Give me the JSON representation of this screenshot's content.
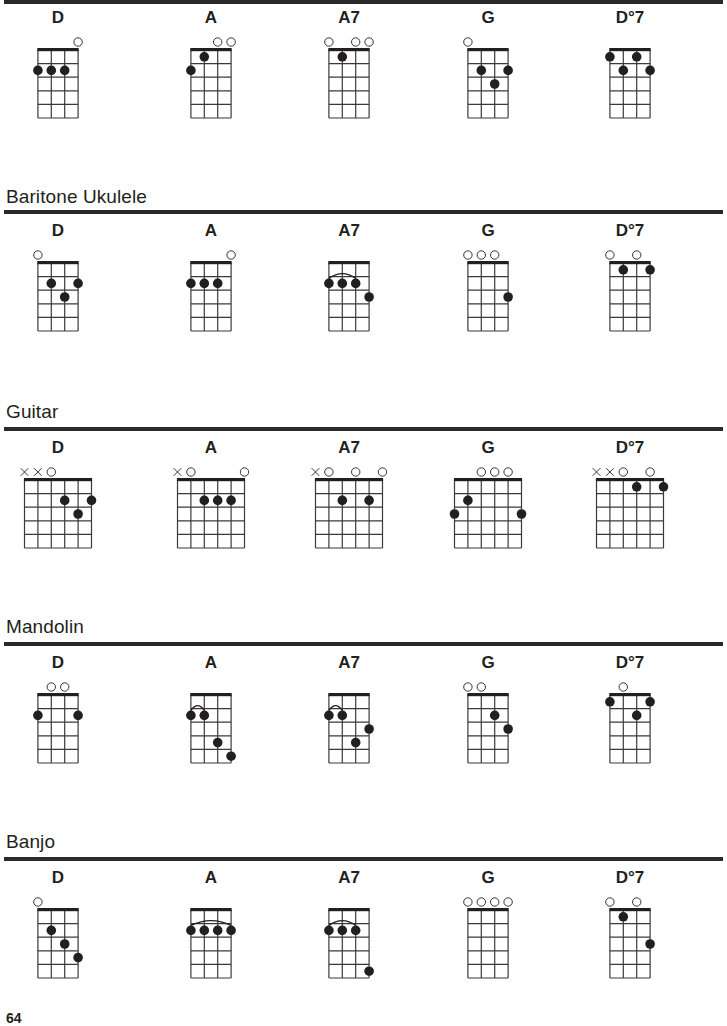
{
  "page": {
    "page_number": "64",
    "chord_names": [
      "D",
      "A",
      "A7",
      "G",
      "D°7"
    ]
  },
  "sections": [
    {
      "id": "ukulele",
      "title": "",
      "strings": 4,
      "frets": 5,
      "chords": [
        {
          "name": "D",
          "open": [
            4
          ],
          "muted": [],
          "dots": [
            [
              1,
              2
            ],
            [
              2,
              2
            ],
            [
              3,
              2
            ]
          ],
          "barre": null
        },
        {
          "name": "A",
          "open": [
            3,
            4
          ],
          "muted": [],
          "dots": [
            [
              1,
              2
            ],
            [
              2,
              1
            ]
          ],
          "barre": null
        },
        {
          "name": "A7",
          "open": [
            1,
            3,
            4
          ],
          "muted": [],
          "dots": [
            [
              2,
              1
            ]
          ],
          "barre": null
        },
        {
          "name": "G",
          "open": [
            1
          ],
          "muted": [],
          "dots": [
            [
              2,
              2
            ],
            [
              3,
              3
            ],
            [
              4,
              2
            ]
          ],
          "barre": null
        },
        {
          "name": "D°7",
          "open": [],
          "muted": [],
          "dots": [
            [
              1,
              1
            ],
            [
              2,
              2
            ],
            [
              3,
              1
            ],
            [
              4,
              2
            ]
          ],
          "barre": null
        }
      ]
    },
    {
      "id": "baritone-ukulele",
      "title": "Baritone Ukulele",
      "strings": 4,
      "frets": 5,
      "chords": [
        {
          "name": "D",
          "open": [
            1
          ],
          "muted": [],
          "dots": [
            [
              2,
              2
            ],
            [
              3,
              3
            ],
            [
              4,
              2
            ]
          ],
          "barre": null
        },
        {
          "name": "A",
          "open": [
            4
          ],
          "muted": [],
          "dots": [
            [
              1,
              2
            ],
            [
              2,
              2
            ],
            [
              3,
              2
            ]
          ],
          "barre": null
        },
        {
          "name": "A7",
          "open": [],
          "muted": [],
          "dots": [
            [
              1,
              2
            ],
            [
              2,
              2
            ],
            [
              3,
              2
            ],
            [
              4,
              3
            ]
          ],
          "barre": [
            1,
            3,
            2
          ]
        },
        {
          "name": "G",
          "open": [
            1,
            2,
            3
          ],
          "muted": [],
          "dots": [
            [
              4,
              3
            ]
          ],
          "barre": null
        },
        {
          "name": "D°7",
          "open": [
            1,
            3
          ],
          "muted": [],
          "dots": [
            [
              2,
              1
            ],
            [
              4,
              1
            ]
          ],
          "barre": null
        }
      ]
    },
    {
      "id": "guitar",
      "title": "Guitar",
      "strings": 6,
      "frets": 5,
      "chords": [
        {
          "name": "D",
          "open": [
            3
          ],
          "muted": [
            1,
            2
          ],
          "dots": [
            [
              4,
              2
            ],
            [
              5,
              3
            ],
            [
              6,
              2
            ]
          ],
          "barre": null
        },
        {
          "name": "A",
          "open": [
            2,
            6
          ],
          "muted": [
            1
          ],
          "dots": [
            [
              3,
              2
            ],
            [
              4,
              2
            ],
            [
              5,
              2
            ]
          ],
          "barre": null
        },
        {
          "name": "A7",
          "open": [
            2,
            4,
            6
          ],
          "muted": [
            1
          ],
          "dots": [
            [
              3,
              2
            ],
            [
              5,
              2
            ]
          ],
          "barre": null
        },
        {
          "name": "G",
          "open": [
            3,
            4,
            5
          ],
          "muted": [],
          "dots": [
            [
              1,
              3
            ],
            [
              2,
              2
            ],
            [
              6,
              3
            ]
          ],
          "barre": null
        },
        {
          "name": "D°7",
          "open": [
            3,
            5
          ],
          "muted": [
            1,
            2
          ],
          "dots": [
            [
              4,
              1
            ],
            [
              6,
              1
            ]
          ],
          "barre": null
        }
      ]
    },
    {
      "id": "mandolin",
      "title": "Mandolin",
      "strings": 4,
      "frets": 5,
      "chords": [
        {
          "name": "D",
          "open": [
            2,
            3
          ],
          "muted": [],
          "dots": [
            [
              1,
              2
            ],
            [
              4,
              2
            ]
          ],
          "barre": null
        },
        {
          "name": "A",
          "open": [],
          "muted": [],
          "dots": [
            [
              1,
              2
            ],
            [
              2,
              2
            ],
            [
              3,
              4
            ],
            [
              4,
              5
            ]
          ],
          "barre": [
            1,
            2,
            2
          ]
        },
        {
          "name": "A7",
          "open": [],
          "muted": [],
          "dots": [
            [
              1,
              2
            ],
            [
              2,
              2
            ],
            [
              3,
              4
            ],
            [
              4,
              3
            ]
          ],
          "barre": [
            1,
            2,
            2
          ]
        },
        {
          "name": "G",
          "open": [
            1,
            2
          ],
          "muted": [],
          "dots": [
            [
              3,
              2
            ],
            [
              4,
              3
            ]
          ],
          "barre": null
        },
        {
          "name": "D°7",
          "open": [
            2
          ],
          "muted": [],
          "dots": [
            [
              1,
              1
            ],
            [
              3,
              2
            ],
            [
              4,
              1
            ]
          ],
          "barre": null
        }
      ]
    },
    {
      "id": "banjo",
      "title": "Banjo",
      "strings": 4,
      "frets": 5,
      "chords": [
        {
          "name": "D",
          "open": [
            1
          ],
          "muted": [],
          "dots": [
            [
              2,
              2
            ],
            [
              3,
              3
            ],
            [
              4,
              4
            ]
          ],
          "barre": null
        },
        {
          "name": "A",
          "open": [],
          "muted": [],
          "dots": [
            [
              1,
              2
            ],
            [
              2,
              2
            ],
            [
              3,
              2
            ],
            [
              4,
              2
            ]
          ],
          "barre": [
            1,
            4,
            2
          ]
        },
        {
          "name": "A7",
          "open": [],
          "muted": [],
          "dots": [
            [
              1,
              2
            ],
            [
              2,
              2
            ],
            [
              3,
              2
            ],
            [
              4,
              5
            ]
          ],
          "barre": [
            1,
            3,
            2
          ]
        },
        {
          "name": "G",
          "open": [
            1,
            2,
            3,
            4
          ],
          "muted": [],
          "dots": [],
          "barre": null
        },
        {
          "name": "D°7",
          "open": [
            1,
            3
          ],
          "muted": [],
          "dots": [
            [
              2,
              1
            ],
            [
              4,
              3
            ]
          ],
          "barre": null
        }
      ]
    }
  ],
  "colors": {
    "ink": "#231f20",
    "rule": "#2b2a2a",
    "grid": "#3a3a3a",
    "background": "#ffffff"
  }
}
